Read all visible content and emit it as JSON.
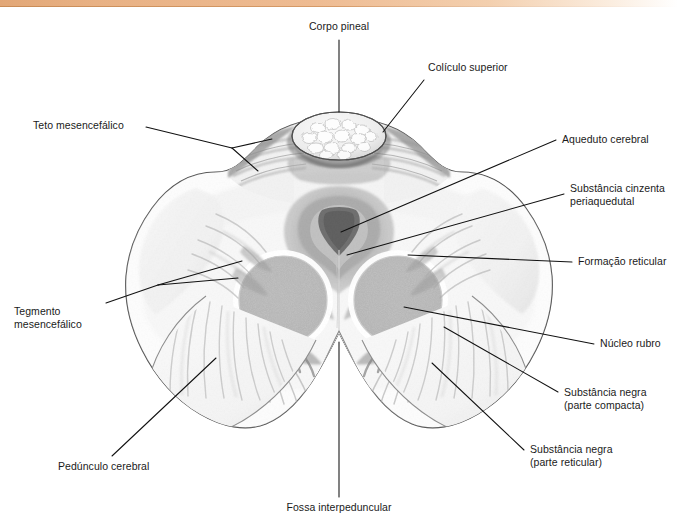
{
  "figure": {
    "decor_bar_color": "#e8b184",
    "line_color": "#111111",
    "ink_color": "#1a1a1a"
  },
  "labels": [
    {
      "id": "corpo-pineal",
      "text": "Corpo pineal",
      "align": "center"
    },
    {
      "id": "coliculo-superior",
      "text": "Colículo superior",
      "align": "left"
    },
    {
      "id": "aqueduto-cerebral",
      "text": "Aqueduto cerebral",
      "align": "left"
    },
    {
      "id": "substancia-cinzenta",
      "text": "Substância cinzenta\nperiaquedutal",
      "align": "left"
    },
    {
      "id": "formacao-reticular",
      "text": "Formação reticular",
      "align": "left"
    },
    {
      "id": "nucleo-rubro",
      "text": "Núcleo rubro",
      "align": "left"
    },
    {
      "id": "substancia-negra-compacta",
      "text": "Substância negra\n(parte compacta)",
      "align": "left"
    },
    {
      "id": "substancia-negra-reticular",
      "text": "Substância negra\n(parte reticular)",
      "align": "left"
    },
    {
      "id": "teto-mesencefalico",
      "text": "Teto mesencefálico",
      "align": "left"
    },
    {
      "id": "tegmento-mesencefalico",
      "text": "Tegmento\nmesencefálico",
      "align": "left"
    },
    {
      "id": "pedunculo-cerebral",
      "text": "Pedúnculo cerebral",
      "align": "left"
    },
    {
      "id": "fossa-interpeduncular",
      "text": "Fossa interpeduncular",
      "align": "center"
    }
  ],
  "structures": [
    {
      "id": "pineal-body",
      "name": "Corpo pineal"
    },
    {
      "id": "superior-colliculus",
      "name": "Colículo superior"
    },
    {
      "id": "cerebral-aqueduct",
      "name": "Aqueduto cerebral"
    },
    {
      "id": "periaqueductal-gray",
      "name": "Substância cinzenta periaquedutal"
    },
    {
      "id": "reticular-formation",
      "name": "Formação reticular"
    },
    {
      "id": "red-nucleus-left",
      "name": "Núcleo rubro (esquerdo)"
    },
    {
      "id": "red-nucleus-right",
      "name": "Núcleo rubro (direito)"
    },
    {
      "id": "substantia-nigra",
      "name": "Substância negra"
    },
    {
      "id": "cerebral-peduncle",
      "name": "Pedúnculo cerebral"
    },
    {
      "id": "interpeduncular-fossa",
      "name": "Fossa interpeduncular"
    }
  ]
}
